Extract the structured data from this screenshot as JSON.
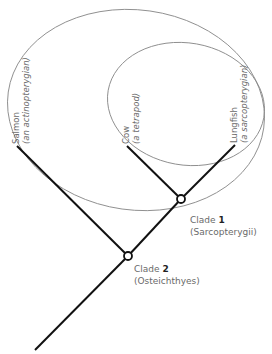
{
  "diagram": {
    "type": "cladogram",
    "taxa": [
      {
        "name": "Salmon",
        "note": "(an actinopterygian)"
      },
      {
        "name": "Cow",
        "note": "(a tetrapod)"
      },
      {
        "name": "Lungfish",
        "note": "(a sarcopterygian)"
      }
    ],
    "clades": [
      {
        "prefix": "Clade ",
        "number": "1",
        "group": "(Sarcopterygii)"
      },
      {
        "prefix": "Clade ",
        "number": "2",
        "group": "(Osteichthyes)"
      }
    ],
    "colors": {
      "branch": "#111111",
      "ellipse": "#8a8a8a",
      "text": "#6a6a6a"
    }
  }
}
